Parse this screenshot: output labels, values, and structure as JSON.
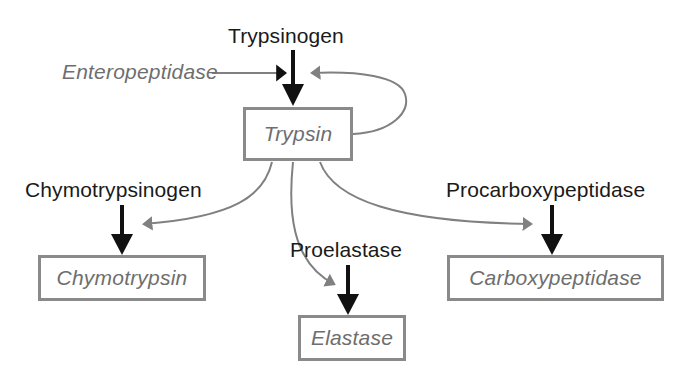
{
  "diagram": {
    "colors": {
      "background": "#ffffff",
      "substrate_text": "#1a1a1a",
      "enzyme_text": "#6e6e6e",
      "box_border": "#8a8a8a",
      "substrate_arrow": "#111111",
      "catalysis_arrow": "#808080"
    },
    "substrate_labels": [
      {
        "id": "trypsinogen",
        "text": "Trypsinogen"
      },
      {
        "id": "chymotrypsinogen",
        "text": "Chymotrypsinogen"
      },
      {
        "id": "proelastase",
        "text": "Proelastase"
      },
      {
        "id": "procarboxypeptidase",
        "text": "Procarboxypeptidase"
      }
    ],
    "enzyme_labels": [
      {
        "id": "enteropeptidase",
        "text": "Enteropeptidase"
      }
    ],
    "boxes": [
      {
        "id": "trypsin",
        "text": "Trypsin"
      },
      {
        "id": "chymotrypsin",
        "text": "Chymotrypsin"
      },
      {
        "id": "elastase",
        "text": "Elastase"
      },
      {
        "id": "carboxypeptidase",
        "text": "Carboxypeptidase"
      }
    ],
    "edges": [
      {
        "id": "trypsinogen-to-trypsin",
        "kind": "substrate",
        "from": "Trypsinogen",
        "to": "Trypsin"
      },
      {
        "id": "enteropeptidase-catalysis",
        "kind": "catalysis",
        "from": "Enteropeptidase",
        "to": "Trypsinogen"
      },
      {
        "id": "trypsin-autocatalysis",
        "kind": "catalysis",
        "from": "Trypsin",
        "to": "Trypsinogen"
      },
      {
        "id": "chymotrypsinogen-to-chymotrypsin",
        "kind": "substrate",
        "from": "Chymotrypsinogen",
        "to": "Chymotrypsin"
      },
      {
        "id": "trypsin-catalysis-chymotrypsinogen",
        "kind": "catalysis",
        "from": "Trypsin",
        "to": "Chymotrypsinogen"
      },
      {
        "id": "proelastase-to-elastase",
        "kind": "substrate",
        "from": "Proelastase",
        "to": "Elastase"
      },
      {
        "id": "trypsin-catalysis-proelastase",
        "kind": "catalysis",
        "from": "Trypsin",
        "to": "Proelastase"
      },
      {
        "id": "procarboxypeptidase-to-carboxypeptidase",
        "kind": "substrate",
        "from": "Procarboxypeptidase",
        "to": "Carboxypeptidase"
      },
      {
        "id": "trypsin-catalysis-procarboxypeptidase",
        "kind": "catalysis",
        "from": "Trypsin",
        "to": "Procarboxypeptidase"
      }
    ]
  }
}
